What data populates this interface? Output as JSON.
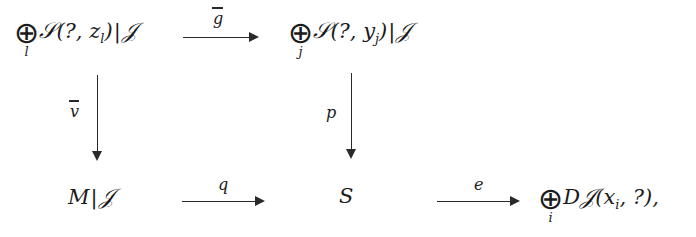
{
  "diagram": {
    "type": "commutative-diagram",
    "nodes": {
      "top_left": {
        "operator": "⊕",
        "operator_index": "l",
        "script_letter": "𝒮",
        "args": "(?, z",
        "arg_sub": "l",
        "args_close": ")",
        "restriction_bar": "|",
        "restriction": "𝒥",
        "plain": "⊕_l 𝒮(?, z_l)|𝒥"
      },
      "top_right": {
        "operator": "⊕",
        "operator_index": "j",
        "script_letter": "𝒮",
        "args": "(?, y",
        "arg_sub": "j",
        "args_close": ")",
        "restriction_bar": "|",
        "restriction": "𝒥",
        "plain": "⊕_j 𝒮(?, y_j)|𝒥"
      },
      "bottom_left": {
        "main": "M",
        "restriction_bar": "|",
        "restriction": "𝒥",
        "plain": "M|𝒥"
      },
      "bottom_mid": {
        "main": "S",
        "plain": "S"
      },
      "bottom_right": {
        "operator": "⊕",
        "operator_index": "i",
        "prefix": "D",
        "script_letter": "𝒥",
        "args": "(x",
        "arg_sub": "i",
        "args_close": ", ?),",
        "plain": "⊕_i D𝒥(x_i, ?),"
      }
    },
    "arrows": {
      "top": {
        "label": "g",
        "overbar": true,
        "direction": "right"
      },
      "left": {
        "label": "v",
        "overbar": true,
        "direction": "down"
      },
      "right": {
        "label": "p",
        "overbar": false,
        "direction": "down"
      },
      "bottom_left": {
        "label": "q",
        "overbar": false,
        "direction": "right"
      },
      "bottom_right": {
        "label": "e",
        "overbar": false,
        "direction": "right"
      }
    },
    "colors": {
      "ink": "#1b1b1b",
      "rule": "#2a2a2a",
      "background": "#ffffff"
    }
  }
}
